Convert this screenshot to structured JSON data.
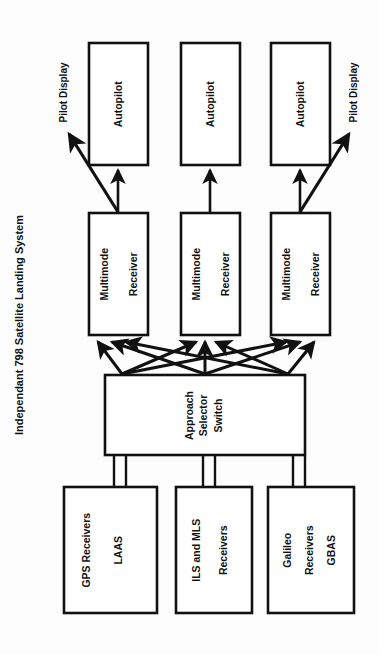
{
  "diagram": {
    "title": "Independant 798 Satellite Landing System",
    "orientation": "rotated-90-ccw",
    "background_color": "#fdfdfd",
    "line_color": "#111111",
    "box_fill": "#ffffff",
    "channels": [
      {
        "id": "channel-left",
        "autopilot": "Autopilot",
        "multimode_receiver": "Multimode\nReceiver",
        "pilot_display": "Pilot Display",
        "has_pilot_display": true
      },
      {
        "id": "channel-center",
        "autopilot": "Autopilot",
        "multimode_receiver": "Multimode\nReceiver",
        "pilot_display": "",
        "has_pilot_display": false
      },
      {
        "id": "channel-right",
        "autopilot": "Autopilot",
        "multimode_receiver": "Multimode\nReceiver",
        "pilot_display": "Pilot Display",
        "has_pilot_display": true
      }
    ],
    "selector": {
      "label": "Approach\nSelector\nSwitch",
      "line1": "Approach",
      "line2": "Selector",
      "line3": "Switch"
    },
    "sources": [
      {
        "id": "source-gps",
        "line1": "GPS Receivers",
        "line2": "LAAS",
        "label": "GPS Receivers LAAS"
      },
      {
        "id": "source-ils-mls",
        "line1": "ILS and MLS",
        "line2": "Receivers",
        "label": "ILS and MLS Receivers"
      },
      {
        "id": "source-galileo",
        "line1": "Galileo",
        "line2": "Receivers",
        "line3": "GBAS",
        "label": "Galileo Receivers GBAS"
      }
    ],
    "labels": {
      "pilot_display_left": "Pilot Display",
      "pilot_display_right": "Pilot Display",
      "autopilot": "Autopilot",
      "multimode_line1": "Multimode",
      "multimode_line2": "Receiver"
    }
  }
}
